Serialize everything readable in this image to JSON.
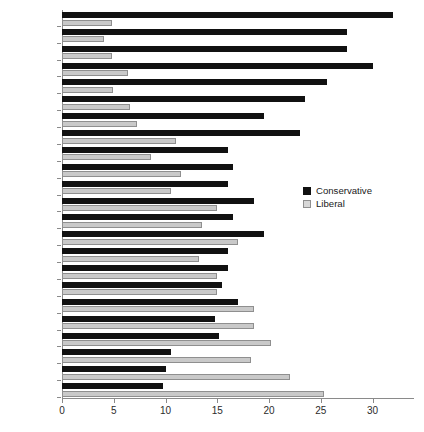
{
  "chart_data": {
    "type": "bar",
    "orientation": "horizontal",
    "title": "",
    "subtitle": "",
    "xlabel": "",
    "ylabel": "",
    "xlim": [
      0,
      34
    ],
    "xticks": [
      0,
      5,
      10,
      15,
      20,
      25,
      30
    ],
    "grid": false,
    "legend_position": "middle-right",
    "categories": [
      "Poland",
      "Italy",
      "Slovakia",
      "Lithuania",
      "Greece",
      "Czechia",
      "Hungary",
      "Spain",
      "Portugal",
      "Estonia",
      "Slovenia",
      "Norway",
      "Ireland",
      "Austria",
      "Belgium",
      "Great Britain",
      "Finland",
      "Germany",
      "France",
      "Denmark",
      "Netherlands",
      "Switzerland",
      "Sweden"
    ],
    "series": [
      {
        "name": "Conservative",
        "color": "#111111",
        "values": [
          32.0,
          27.5,
          27.5,
          30.0,
          25.6,
          23.5,
          19.5,
          23.0,
          16.0,
          16.5,
          16.0,
          18.5,
          16.5,
          19.5,
          16.0,
          16.0,
          15.5,
          17.0,
          14.8,
          15.2,
          10.5,
          10.0,
          9.8
        ]
      },
      {
        "name": "Liberal",
        "color": "#c9c9c9",
        "values": [
          4.8,
          4.1,
          4.8,
          6.4,
          4.9,
          6.6,
          7.2,
          11.0,
          8.6,
          11.5,
          10.5,
          15.0,
          13.5,
          17.0,
          13.2,
          15.0,
          15.0,
          18.5,
          18.5,
          20.2,
          18.3,
          22.0,
          25.3
        ]
      }
    ]
  },
  "legend": {
    "items": [
      {
        "label": "Conservative",
        "swatch": "filled-black-square"
      },
      {
        "label": "Liberal",
        "swatch": "outlined-gray-square"
      }
    ]
  },
  "axis": {
    "x_tick_labels": [
      "0",
      "5",
      "10",
      "15",
      "20",
      "25",
      "30"
    ]
  },
  "colors": {
    "conservative": "#111111",
    "liberal": "#c9c9c9",
    "axis": "#8a8a8a",
    "text": "#2b2b2b",
    "background": "#ffffff"
  }
}
